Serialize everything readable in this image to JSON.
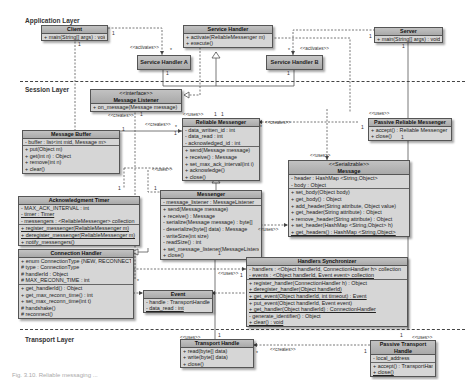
{
  "layers": {
    "application": "Application Layer",
    "session": "Session Layer",
    "transport": "Transport Layer"
  },
  "classes": {
    "client": {
      "name": "Client",
      "methods": [
        "+ main(String[] args) : void"
      ]
    },
    "service_handler": {
      "name": "Service Handler",
      "methods": [
        "+ activate(ReliableMessenger m)",
        "+ execute()"
      ]
    },
    "server": {
      "name": "Server",
      "methods": [
        "+ main(String[] args) : void"
      ]
    },
    "service_handler_a": {
      "name": "Service Handler A"
    },
    "service_handler_b": {
      "name": "Service Handler B"
    },
    "message_listener": {
      "stereotype": "<<interface>>",
      "name": "Message Listener",
      "methods": [
        "+ on_message(Message message)"
      ]
    },
    "reliable_messenger": {
      "name": "Reliable Messenger",
      "attributes": [
        "- data_written_id : int",
        "- data_read : int",
        "- acknowledged_id : int"
      ],
      "methods": [
        "+ send(Message message)",
        "+ receive() : Message",
        "+ set_max_ack_interval(int i)",
        "+ acknowledge()",
        "+ close()"
      ]
    },
    "message_buffer": {
      "name": "Message Buffer",
      "attributes": [
        "- buffer : list<int mid, Message m>"
      ],
      "methods": [
        "+ put(Object m)",
        "+ get(int n) : Object",
        "+ remove(int n)",
        "+ clear()"
      ]
    },
    "passive_reliable_messenger": {
      "name": "Passive Reliable Messenger",
      "methods": [
        "+ accept() : Reliable Messenger",
        "+ close()"
      ]
    },
    "acknowledgment_timer": {
      "name": "Acknowledgment Timer",
      "attributes": [
        "- MAX_ACK_INTERVAL : int",
        "- timer : Timer",
        "- messengers : <ReliableMessenger> collection"
      ],
      "methods": [
        "+ register_messenger(ReliableMessenger m)",
        "+ deregister_messenger(ReliableMessenger m)",
        "+ notify_messengers()"
      ]
    },
    "messenger": {
      "name": "Messenger",
      "attributes": [
        "- message_listener : MessageListener"
      ],
      "methods": [
        "+ send(Message message)",
        "+ receive() : Message",
        "- serialize(Message message) : byte[]",
        "- deserialize(byte[] data) : Message",
        "- writeSize(int size)",
        "- readSize() : int",
        "+ set_message_listener(MessageListener ml)",
        "+ close()"
      ]
    },
    "message": {
      "stereotype": "<<Serializable>>",
      "name": "Message",
      "attributes": [
        "- header : HashMap <String,Object>",
        "- body : Object"
      ],
      "methods": [
        "+ set_body(Object body)",
        "+ get_body() : Object",
        "+ add_header(String attribute, Object value)",
        "+ get_header(String attribute) : Object",
        "+ remove_header(String attribute) : Object",
        "+ set_header(HashMap <String,Object> h)",
        "+ get_headers() : HashMap <String,Object>"
      ]
    },
    "connection_handler": {
      "name": "Connection Handler",
      "attributes": [
        "+ enum ConnectionType {NEW, RECONNECT}",
        "# type : ConnectionType",
        "# handlerId : Object",
        "# MAX_RECONN_TIME : int"
      ],
      "methods": [
        "+ get_handlerId() : Object",
        "+ get_max_reconn_time() : int",
        "+ set_max_reconn_time(int t)",
        "# handshake()",
        "# reconnect()"
      ]
    },
    "event": {
      "name": "Event",
      "attributes": [
        "- handle : TransportHandle",
        "- data_read : int"
      ]
    },
    "handlers_synchronizer": {
      "name": "Handlers Synchronizer",
      "attributes": [
        "- handlers : <Object handlerId, ConnectionHandler h> collection",
        "- events : <Object handlerId, Event event> collection"
      ],
      "methods": [
        "+ register_handler(ConnectionHandler h) : Object",
        "+ deregister_handler(Object handlerId)",
        "+ get_event(Object handlerId, int timeout) : Event",
        "+ put_event(Object handlerId, Event event)",
        "+ get_handler(Object handlerId) : ConnectionHandler",
        "- generate_identifier() : Object",
        "+ clear() : void"
      ]
    },
    "transport_handle": {
      "name": "Transport Handle",
      "methods": [
        "+ read(byte[] data)",
        "+ write(byte[] data)",
        "+ close()"
      ]
    },
    "passive_transport_handle": {
      "name": "Passive Transport Handle",
      "attributes": [
        "- local_address"
      ],
      "methods": [
        "+ accept() : TransportHandle",
        "+ close()"
      ]
    }
  },
  "relations": {
    "activates": "<<activates>>",
    "creates": "<<creates>>",
    "uses": "<<uses>>",
    "one": "1",
    "many": "*"
  },
  "caption": "Fig. 3.10. Reliable messaging ..."
}
